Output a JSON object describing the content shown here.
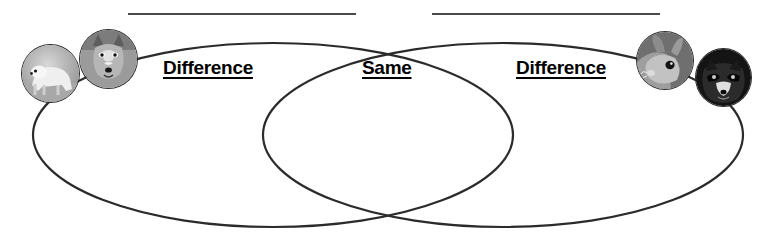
{
  "worksheet": {
    "type": "venn-diagram",
    "title_lines": [
      {
        "name": "left-topic-line",
        "value": ""
      },
      {
        "name": "right-topic-line",
        "value": ""
      }
    ],
    "labels": {
      "difference_left": "Difference",
      "same": "Same",
      "difference_right": "Difference"
    },
    "photos": [
      {
        "name": "polar-bear",
        "side": "left"
      },
      {
        "name": "wolf",
        "side": "left"
      },
      {
        "name": "rabbit",
        "side": "right"
      },
      {
        "name": "raccoon",
        "side": "right"
      }
    ],
    "colors": {
      "stroke": "#2b2b2b",
      "line": "#4a4a4a",
      "text": "#000000",
      "background": "#ffffff"
    }
  }
}
